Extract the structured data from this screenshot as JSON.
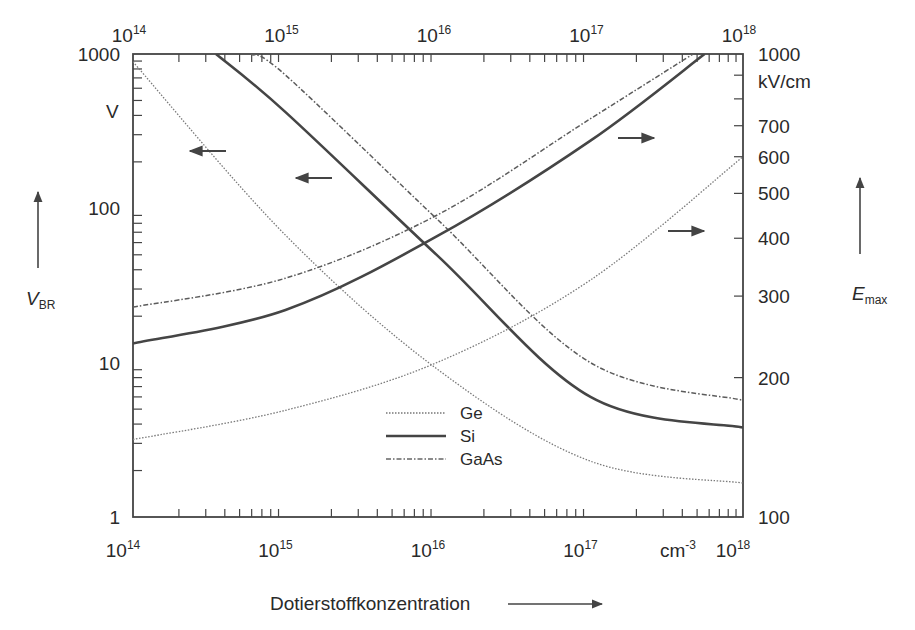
{
  "chart_data": {
    "type": "line",
    "title": "",
    "xlabel": "Dotierstoffkonzentration",
    "x_unit": "cm-3",
    "xscale": "log",
    "xlim": [
      100000000000000.0,
      1e+18
    ],
    "x_ticks": [
      {
        "base": "10",
        "exp": "14"
      },
      {
        "base": "10",
        "exp": "15"
      },
      {
        "base": "10",
        "exp": "16"
      },
      {
        "base": "10",
        "exp": "17"
      },
      {
        "base": "10",
        "exp": "18"
      }
    ],
    "y_left": {
      "label": "V",
      "label_sub": "BR",
      "unit": "V",
      "scale": "log",
      "lim": [
        1,
        1000
      ],
      "ticks": [
        "1",
        "10",
        "100",
        "1000"
      ]
    },
    "y_right": {
      "label": "E",
      "label_sub": "max",
      "unit": "kV/cm",
      "scale": "log",
      "lim": [
        100,
        1000
      ],
      "ticks": [
        "100",
        "200",
        "300",
        "400",
        "500",
        "600",
        "700",
        "1000"
      ]
    },
    "grid": false,
    "legend_position": "bottom-center",
    "series": [
      {
        "name": "Ge",
        "quantity": "V_BR",
        "axis": "left",
        "style": "dotted",
        "x": [
          100000000000000.0,
          1000000000000000.0,
          1e+16,
          1e+17,
          1e+18
        ],
        "values": [
          890,
          67,
          9,
          2.3,
          1.66
        ]
      },
      {
        "name": "Si",
        "quantity": "V_BR",
        "axis": "left",
        "style": "solid",
        "x": [
          350000000000000.0,
          1000000000000000.0,
          1e+16,
          1e+17,
          1e+18
        ],
        "values": [
          1000,
          420,
          49,
          6,
          3.8
        ]
      },
      {
        "name": "GaAs",
        "quantity": "V_BR",
        "axis": "left",
        "style": "dashdot",
        "x": [
          590000000000000.0,
          1000000000000000.0,
          1e+16,
          1e+17,
          1e+18
        ],
        "values": [
          1000,
          730,
          84,
          10,
          5.7
        ]
      },
      {
        "name": "Ge",
        "quantity": "E_max",
        "axis": "right",
        "style": "dotted",
        "x": [
          100000000000000.0,
          1000000000000000.0,
          1e+16,
          1e+17,
          1e+18
        ],
        "values": [
          147,
          170,
          216,
          325,
          600
        ]
      },
      {
        "name": "Si",
        "quantity": "E_max",
        "axis": "right",
        "style": "solid",
        "x": [
          100000000000000.0,
          1000000000000000.0,
          1e+16,
          1e+17,
          5.6e+17
        ],
        "values": [
          237,
          280,
          405,
          650,
          1000
        ]
      },
      {
        "name": "GaAs",
        "quantity": "E_max",
        "axis": "right",
        "style": "dashdot",
        "x": [
          100000000000000.0,
          1000000000000000.0,
          1e+16,
          1e+17,
          4.7e+17
        ],
        "values": [
          284,
          328,
          450,
          725,
          1000
        ]
      }
    ],
    "legend": [
      "Ge",
      "Si",
      "GaAs"
    ],
    "annotations": [
      {
        "type": "arrow",
        "direction": "left",
        "meaning": "V_BR curves use left axis"
      },
      {
        "type": "arrow",
        "direction": "left",
        "meaning": "V_BR curves use left axis"
      },
      {
        "type": "arrow",
        "direction": "right",
        "meaning": "E_max curves use right axis"
      },
      {
        "type": "arrow",
        "direction": "right",
        "meaning": "E_max curves use right axis"
      }
    ]
  }
}
